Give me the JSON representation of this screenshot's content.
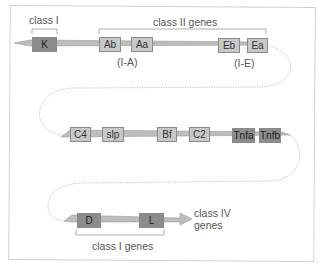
{
  "diagram": {
    "title": "",
    "colors": {
      "light_gene": "#c8c8c8",
      "dark_gene": "#8c8c8c",
      "chromosome": "#bdbdbd",
      "loop": "#bbbbbb"
    },
    "row1": {
      "bracket_class_I": "class I",
      "bracket_class_II": "class II genes",
      "genes": [
        {
          "label": "K",
          "shade": "dark"
        },
        {
          "label": "Ab",
          "shade": "light"
        },
        {
          "label": "Aa",
          "shade": "light"
        },
        {
          "label": "Eb",
          "shade": "light"
        },
        {
          "label": "Ea",
          "shade": "light"
        }
      ],
      "sublabels": [
        "(I-A)",
        "(I-E)"
      ]
    },
    "row2": {
      "genes": [
        {
          "label": "C4",
          "shade": "light"
        },
        {
          "label": "slp",
          "shade": "light"
        },
        {
          "label": "Bf",
          "shade": "light"
        },
        {
          "label": "C2",
          "shade": "light"
        },
        {
          "label": "Tnfa",
          "shade": "dark"
        },
        {
          "label": "Tnfb",
          "shade": "dark"
        }
      ]
    },
    "row3": {
      "genes": [
        {
          "label": "D",
          "shade": "dark"
        },
        {
          "label": "L",
          "shade": "dark"
        }
      ],
      "arrow_label_line1": "class IV",
      "arrow_label_line2": "genes",
      "bracket_class_I_genes": "class I genes"
    }
  }
}
